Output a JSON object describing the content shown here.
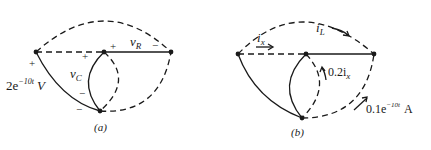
{
  "figure_a": {
    "caption": "(a)",
    "labels": {
      "source_voltage": "2e",
      "source_exp": "−10t",
      "source_unit": "V",
      "vc": "v",
      "vc_sub": "C",
      "vr": "v",
      "vr_sub": "R",
      "plus": "+",
      "minus": "−"
    }
  },
  "figure_b": {
    "caption": "(b)",
    "labels": {
      "ix": "i",
      "ix_sub": "x",
      "il": "i",
      "il_sub": "L",
      "dep_source": "0.2i",
      "dep_sub": "x",
      "cur_source": "0.1e",
      "cur_exp": "−10t",
      "cur_unit": "A"
    }
  },
  "colors": {
    "line": "#1a1a1a",
    "background": "#ffffff"
  }
}
